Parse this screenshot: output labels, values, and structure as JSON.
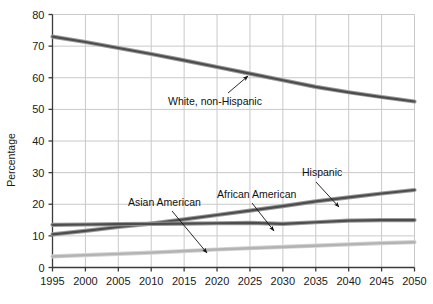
{
  "chart_data": {
    "type": "line",
    "title": "",
    "xlabel": "",
    "ylabel": "Percentage",
    "xlim": [
      1995,
      2050
    ],
    "ylim": [
      0,
      80
    ],
    "grid": true,
    "legend_position": "inline-annotations",
    "x": [
      1995,
      2000,
      2005,
      2010,
      2015,
      2020,
      2025,
      2030,
      2035,
      2040,
      2045,
      2050
    ],
    "xticks": [
      "1995",
      "2000",
      "2005",
      "2010",
      "2015",
      "2020",
      "2025",
      "2030",
      "2035",
      "2040",
      "2045",
      "2050"
    ],
    "yticks": [
      "0",
      "10",
      "20",
      "30",
      "40",
      "50",
      "60",
      "70",
      "80"
    ],
    "series": [
      {
        "name": "White, non-Hispanic",
        "color": "#4d4d4d",
        "values": [
          73.0,
          71.3,
          69.4,
          67.5,
          65.5,
          63.4,
          61.3,
          59.2,
          57.1,
          55.4,
          53.9,
          52.5
        ]
      },
      {
        "name": "Hispanic",
        "color": "#4d4d4d",
        "values": [
          10.5,
          11.6,
          12.8,
          13.9,
          15.2,
          16.6,
          18.0,
          19.4,
          20.9,
          22.2,
          23.4,
          24.5
        ]
      },
      {
        "name": "African American",
        "color": "#4d4d4d",
        "values": [
          13.5,
          13.6,
          13.7,
          13.8,
          13.9,
          14.0,
          14.1,
          13.8,
          14.3,
          14.8,
          15.0,
          15.0
        ]
      },
      {
        "name": "Asian American",
        "color": "#b3b3b3",
        "values": [
          3.5,
          3.9,
          4.3,
          4.7,
          5.2,
          5.7,
          6.1,
          6.5,
          6.9,
          7.3,
          7.7,
          8.0
        ]
      }
    ],
    "annotations": [
      {
        "text": "White, non-Hispanic",
        "text_x": 168,
        "text_y": 105,
        "arrow_from_x": 228,
        "arrow_from_y": 93,
        "arrow_to_x": 248,
        "arrow_to_y": 76
      },
      {
        "text": "Asian American",
        "text_x": 128,
        "text_y": 206,
        "arrow_from_x": 172,
        "arrow_from_y": 211,
        "arrow_to_x": 207,
        "arrow_to_y": 253
      },
      {
        "text": "African American",
        "text_x": 217,
        "text_y": 198,
        "arrow_from_x": 252,
        "arrow_from_y": 203,
        "arrow_to_x": 274,
        "arrow_to_y": 231
      },
      {
        "text": "Hispanic",
        "text_x": 302,
        "text_y": 176,
        "arrow_from_x": 316,
        "arrow_from_y": 182,
        "arrow_to_x": 339,
        "arrow_to_y": 207
      }
    ]
  },
  "axes": {
    "y_title": "Percentage"
  },
  "colors": {
    "axis": "#3a3a3a",
    "grid": "#c9c9c9",
    "dark_series": "#4d4d4d",
    "light_series": "#b3b3b3",
    "background": "#ffffff"
  }
}
